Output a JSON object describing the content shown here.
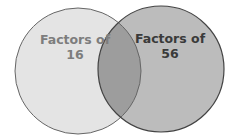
{
  "diagram": {
    "type": "venn",
    "sets": [
      {
        "label_line1": "Factors of",
        "label_line2": "16",
        "fill": "#e4e4e4",
        "text_color": "#7d7d7d"
      },
      {
        "label_line1": "Factors of",
        "label_line2": "56",
        "fill": "#bcbcbc",
        "text_color": "#3a3a3a"
      }
    ],
    "overlap_fill": "#9d9d9d",
    "outline_color": "#555555"
  }
}
